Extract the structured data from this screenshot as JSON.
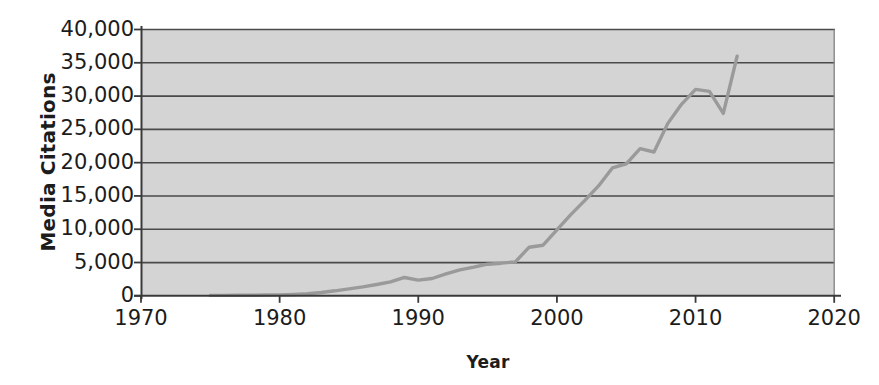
{
  "chart_data": {
    "type": "line",
    "title": "",
    "xlabel": "Year",
    "ylabel": "Media Citations",
    "xlim": [
      1970,
      2020
    ],
    "ylim": [
      0,
      40000
    ],
    "grid": true,
    "grid_axis": "y",
    "legend": false,
    "x_ticks": [
      1970,
      1980,
      1990,
      2000,
      2010,
      2020
    ],
    "x_tick_labels": [
      "1970",
      "1980",
      "1990",
      "2000",
      "2010",
      "2020"
    ],
    "y_ticks": [
      0,
      5000,
      10000,
      15000,
      20000,
      25000,
      30000,
      35000,
      40000
    ],
    "y_tick_labels": [
      "0",
      "5,000",
      "10,000",
      "15,000",
      "20,000",
      "25,000",
      "30,000",
      "35,000",
      "40,000"
    ],
    "series": [
      {
        "name": "Media Citations",
        "color": "#9a9a9a",
        "x": [
          1975,
          1976,
          1977,
          1978,
          1979,
          1980,
          1981,
          1982,
          1983,
          1984,
          1985,
          1986,
          1987,
          1988,
          1989,
          1990,
          1991,
          1992,
          1993,
          1994,
          1995,
          1996,
          1997,
          1998,
          1999,
          2000,
          2001,
          2002,
          2003,
          2004,
          2005,
          2006,
          2007,
          2008,
          2009,
          2010,
          2011,
          2012,
          2013
        ],
        "values": [
          60,
          70,
          80,
          90,
          110,
          140,
          200,
          300,
          500,
          750,
          1050,
          1350,
          1700,
          2100,
          2750,
          2350,
          2600,
          3300,
          3900,
          4300,
          4750,
          4900,
          5100,
          7300,
          7600,
          9900,
          12200,
          14300,
          16500,
          19200,
          19800,
          22100,
          21600,
          25900,
          28800,
          31000,
          30700,
          27400,
          36000
        ]
      }
    ],
    "colors": {
      "plot_background": "#d4d4d4",
      "gridline": "#4a4a4a",
      "axis": "#4a4a4a",
      "line": "#9a9a9a",
      "text": "#1c1c1c",
      "page_background": "#ffffff"
    }
  }
}
